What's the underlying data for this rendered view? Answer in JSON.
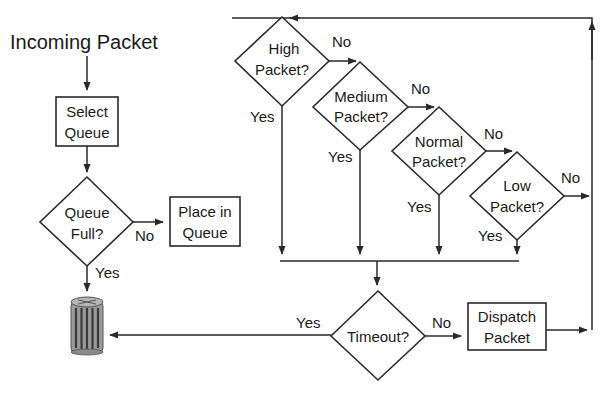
{
  "diagram": {
    "title": "Incoming Packet",
    "nodes": {
      "select_queue": {
        "line1": "Select",
        "line2": "Queue"
      },
      "queue_full": {
        "line1": "Queue",
        "line2": "Full?"
      },
      "place_in_queue": {
        "line1": "Place in",
        "line2": "Queue"
      },
      "high_packet": {
        "line1": "High",
        "line2": "Packet?"
      },
      "medium_packet": {
        "line1": "Medium",
        "line2": "Packet?"
      },
      "normal_packet": {
        "line1": "Normal",
        "line2": "Packet?"
      },
      "low_packet": {
        "line1": "Low",
        "line2": "Packet?"
      },
      "timeout": {
        "line1": "Timeout?"
      },
      "dispatch_packet": {
        "line1": "Dispatch",
        "line2": "Packet"
      },
      "trash": {
        "icon": "trash-can-icon"
      }
    },
    "edge_labels": {
      "queue_full_no": "No",
      "queue_full_yes": "Yes",
      "high_no": "No",
      "high_yes": "Yes",
      "medium_no": "No",
      "medium_yes": "Yes",
      "normal_no": "No",
      "normal_yes": "Yes",
      "low_no": "No",
      "low_yes": "Yes",
      "timeout_yes": "Yes",
      "timeout_no": "No"
    },
    "colors": {
      "stroke": "#2a2a2a",
      "background": "#ffffff",
      "trash_fill": "#8a8a8a"
    }
  }
}
